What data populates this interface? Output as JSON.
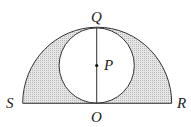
{
  "diagram": {
    "type": "geometry",
    "labels": {
      "Q": "Q",
      "P": "P",
      "S": "S",
      "R": "R",
      "O": "O"
    },
    "colors": {
      "stroke": "#333333",
      "shade": "#d4d4d4",
      "background": "#ffffff"
    }
  }
}
